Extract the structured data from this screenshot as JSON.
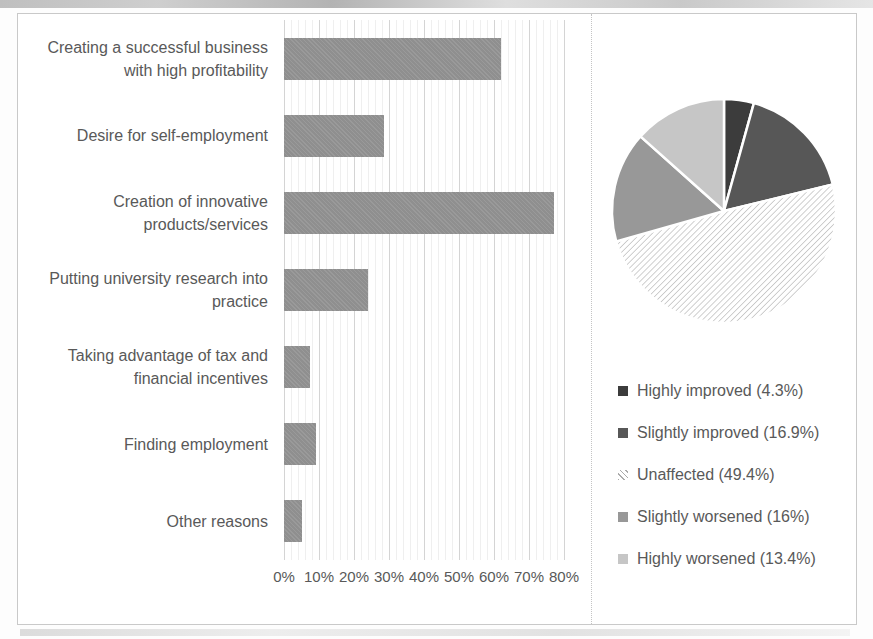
{
  "figure": {
    "background": "#ffffff",
    "border_color": "#c9c9c9",
    "text_color": "#595959"
  },
  "chart_data": [
    {
      "type": "bar",
      "orientation": "horizontal",
      "title": "",
      "xlabel": "",
      "ylabel": "",
      "unit": "%",
      "categories": [
        "Creating a successful business with high profitability",
        "Desire for self-employment",
        "Creation of innovative products/services",
        "Putting university research into practice",
        "Taking advantage of tax and financial incentives",
        "Finding employment",
        "Other reasons"
      ],
      "values": [
        62,
        28.5,
        77,
        24,
        7.5,
        9,
        5
      ],
      "xlim": [
        0,
        80
      ],
      "x_ticks": [
        "0%",
        "10%",
        "20%",
        "30%",
        "40%",
        "50%",
        "60%",
        "70%",
        "80%"
      ],
      "grid": true,
      "minor_grid": true,
      "bar_color": "#8f8f8f"
    },
    {
      "type": "pie",
      "title": "",
      "start_angle_deg": 0,
      "direction": "clockwise",
      "legend_position": "below",
      "slices": [
        {
          "label": "Highly improved (4.3%)",
          "name": "Highly improved",
          "value": 4.3,
          "color": "#3c3c3c",
          "pattern": "solid"
        },
        {
          "label": "Slightly improved (16.9%)",
          "name": "Slightly improved",
          "value": 16.9,
          "color": "#575757",
          "pattern": "solid"
        },
        {
          "label": "Unaffected (49.4%)",
          "name": "Unaffected",
          "value": 49.4,
          "color": "#ffffff",
          "pattern": "diagonal-hatch",
          "hatch_color": "#a9a9a9"
        },
        {
          "label": "Slightly worsened (16%)",
          "name": "Slightly worsened",
          "value": 16,
          "color": "#989898",
          "pattern": "solid"
        },
        {
          "label": "Highly worsened (13.4%)",
          "name": "Highly worsened",
          "value": 13.4,
          "color": "#c6c6c6",
          "pattern": "solid"
        }
      ]
    }
  ]
}
